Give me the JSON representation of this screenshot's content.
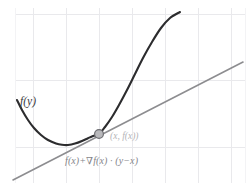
{
  "figure": {
    "width": 248,
    "height": 191,
    "background_color": "#ffffff",
    "labels": {
      "function_label": "f(y)",
      "point_label": "(x, f(x))",
      "tangent_label": "f(x)+∇f(x) · (y−x)"
    },
    "colors": {
      "curve": "#2c2c2e",
      "tangent": "#8d8d90",
      "grid": "#e9e9ec",
      "grid_faint": "#f3f3f5",
      "marker_fill": "#b9b9bc",
      "marker_stroke": "#6e6e72",
      "function_label_color": "#3a3a3c",
      "point_label_color": "#b4b4b8",
      "tangent_label_color": "#85858a"
    }
  },
  "chart_data": {
    "type": "line",
    "title": "",
    "subtitle": "",
    "xlabel": "",
    "ylabel": "",
    "grid": true,
    "legend": false,
    "xlim": [
      0,
      248
    ],
    "ylim": [
      191,
      0
    ],
    "annotations": [
      {
        "name": "function-label",
        "text": "f(y)",
        "x": 20,
        "y": 103
      },
      {
        "name": "point-label",
        "text": "(x, f(x))",
        "x": 110,
        "y": 139
      },
      {
        "name": "tangent-label",
        "text": "f(x)+∇f(x) · (y−x)",
        "x": 65,
        "y": 163
      }
    ],
    "markers": [
      {
        "name": "tangency-point",
        "x": 99,
        "y": 134,
        "radius": 4.4
      }
    ],
    "grid_lines": {
      "horizontal": [
        14,
        80,
        147
      ],
      "horizontal_faint": [],
      "vertical": [
        33,
        66,
        99,
        132,
        165,
        198,
        231
      ],
      "vertical_faint": [
        15,
        245
      ],
      "x_extent": [
        15,
        245
      ],
      "y_extent": [
        8,
        183
      ]
    },
    "series": [
      {
        "name": "f(y)",
        "kind": "parabola",
        "stroke": "#2c2c2e",
        "points": [
          [
            17,
            100
          ],
          [
            22,
            110
          ],
          [
            28,
            120
          ],
          [
            34,
            128
          ],
          [
            41,
            135
          ],
          [
            48,
            140
          ],
          [
            56,
            143.5
          ],
          [
            62,
            144.8
          ],
          [
            68,
            145
          ],
          [
            75,
            143.6
          ],
          [
            82,
            141
          ],
          [
            88,
            138.2
          ],
          [
            93,
            136
          ],
          [
            99,
            134
          ],
          [
            105,
            127
          ],
          [
            112,
            117
          ],
          [
            119,
            105
          ],
          [
            127,
            90
          ],
          [
            135,
            74
          ],
          [
            143,
            58
          ],
          [
            152,
            42
          ],
          [
            161,
            28
          ],
          [
            170,
            18
          ],
          [
            180,
            12
          ]
        ]
      },
      {
        "name": "f(x)+∇f(x) · (y−x)",
        "kind": "tangent-line",
        "stroke": "#8d8d90",
        "points": [
          [
            13,
            180
          ],
          [
            243,
            62
          ]
        ]
      }
    ]
  }
}
